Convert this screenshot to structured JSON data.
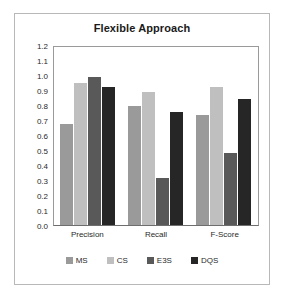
{
  "chart_data": {
    "type": "bar",
    "title": "Flexible Approach",
    "xlabel": "",
    "ylabel": "",
    "categories": [
      "Precision",
      "Recall",
      "F-Score"
    ],
    "series": [
      {
        "name": "MS",
        "color": "#9a9a9a",
        "values": [
          0.68,
          0.8,
          0.74
        ]
      },
      {
        "name": "CS",
        "color": "#bfbfbf",
        "values": [
          0.96,
          0.9,
          0.93
        ]
      },
      {
        "name": "E3S",
        "color": "#595959",
        "values": [
          1.0,
          0.32,
          0.485
        ]
      },
      {
        "name": "DQS",
        "color": "#262626",
        "values": [
          0.93,
          0.76,
          0.85
        ]
      }
    ],
    "ylim": [
      0.0,
      1.2
    ],
    "y_ticks": [
      "1.2",
      "1.1",
      "1.0",
      "0.9",
      "0.8",
      "0.7",
      "0.6",
      "0.5",
      "0.4",
      "0.3",
      "0.2",
      "0.1",
      "0.0"
    ],
    "y_tick_values": [
      1.2,
      1.1,
      1.0,
      0.9,
      0.8,
      0.7,
      0.6,
      0.5,
      0.4,
      0.3,
      0.2,
      0.1,
      0.0
    ],
    "grid": false,
    "legend_position": "bottom"
  }
}
